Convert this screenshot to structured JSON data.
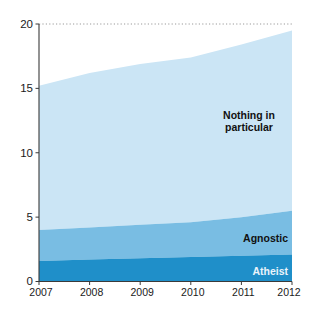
{
  "chart_data": {
    "type": "area",
    "stacked": true,
    "title": "",
    "subtitle": "",
    "xlabel": "",
    "ylabel": "",
    "x": [
      2007,
      2008,
      2009,
      2010,
      2011,
      2012
    ],
    "categories": [
      "2007",
      "2008",
      "2009",
      "2010",
      "2011",
      "2012"
    ],
    "series": [
      {
        "name": "Atheist",
        "color": "#1f8fc9",
        "values": [
          1.6,
          1.7,
          1.8,
          1.9,
          2.0,
          2.1
        ]
      },
      {
        "name": "Agnostic",
        "color": "#79bde3",
        "values": [
          2.4,
          2.5,
          2.6,
          2.7,
          3.0,
          3.4
        ]
      },
      {
        "name": "Nothing in particular",
        "color": "#cbe5f5",
        "values": [
          11.2,
          12.0,
          12.5,
          12.8,
          13.4,
          14.0
        ]
      }
    ],
    "stack_totals": [
      15.2,
      16.2,
      16.9,
      17.4,
      18.4,
      19.5
    ],
    "ylim": [
      0,
      20
    ],
    "xlim": [
      2007,
      2012
    ],
    "yticks": [
      0,
      5,
      10,
      15,
      20
    ],
    "ytick_labels": [
      "0",
      "5",
      "10",
      "15",
      "20"
    ],
    "xtick_labels": [
      "2007",
      "2008",
      "2009",
      "2010",
      "2011",
      "2012"
    ],
    "grid": true,
    "gridlines": [
      20
    ],
    "grid_style": "dotted",
    "legend_position": "inline-annotations",
    "annotations": [
      {
        "text": "Nothing in",
        "x": 2011.05,
        "y": 13.1,
        "series": "Nothing in particular",
        "style": "dark-bold"
      },
      {
        "text": "particular",
        "x": 2011.05,
        "y": 12.1,
        "series": "Nothing in particular",
        "style": "dark-bold"
      },
      {
        "text": "Agnostic",
        "x": 2011.2,
        "y": 4.05,
        "series": "Agnostic",
        "style": "dark-bold"
      },
      {
        "text": "Atheist",
        "x": 2011.35,
        "y": 1.05,
        "series": "Atheist",
        "style": "light-bold"
      }
    ]
  },
  "colors": {
    "atheist": "#1f8fc9",
    "agnostic": "#79bde3",
    "nothing_in_particular": "#cbe5f5",
    "axis": "#3a3a3a",
    "grid": "#9a9a9a",
    "background": "#ffffff",
    "tick_text": "#1a1a1a"
  },
  "axis": {
    "y_labels": [
      "20",
      "15",
      "10",
      "5",
      "0"
    ],
    "x_labels": [
      "2007",
      "2008",
      "2009",
      "2010",
      "2011",
      "2012"
    ]
  }
}
